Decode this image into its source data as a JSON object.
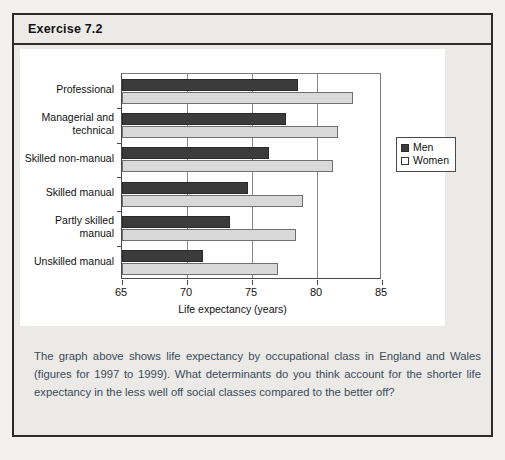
{
  "exercise": {
    "title": "Exercise 7.2",
    "caption": "The graph above shows life expectancy by occupational class in England and Wales (figures for 1997 to 1999). What determinants do you think account for the shorter life expectancy in the less well off social classes compared to the better off?"
  },
  "colors": {
    "men_bar": "#3b3b3b",
    "women_bar": "#d9d9d9",
    "panel_bg": "#ffffff",
    "page_bg": "#eceae7",
    "border": "#2b2b2b",
    "caption_text": "#3a4a5a"
  },
  "chart_data": {
    "type": "bar",
    "orientation": "horizontal",
    "title": "",
    "xlabel": "Life expectancy (years)",
    "ylabel": "",
    "xlim": [
      65,
      85
    ],
    "xticks": [
      65,
      70,
      75,
      80,
      85
    ],
    "xtick_labels": [
      "65",
      "70",
      "75",
      "80",
      "85"
    ],
    "grid": true,
    "grid_axis": "x",
    "legend_position": "right",
    "categories": [
      "Professional",
      "Managerial and technical",
      "Skilled non-manual",
      "Skilled manual",
      "Partly skilled manual",
      "Unskilled manual"
    ],
    "category_labels": [
      [
        "Professional"
      ],
      [
        "Managerial and",
        "technical"
      ],
      [
        "Skilled non-manual"
      ],
      [
        "Skilled manual"
      ],
      [
        "Partly skilled",
        "manual"
      ],
      [
        "Unskilled manual"
      ]
    ],
    "series": [
      {
        "name": "Men",
        "color": "#3b3b3b",
        "values": [
          78.5,
          77.6,
          76.3,
          74.7,
          73.3,
          71.2
        ]
      },
      {
        "name": "Women",
        "color": "#d9d9d9",
        "values": [
          82.8,
          81.6,
          81.2,
          78.9,
          78.4,
          77.0
        ]
      }
    ]
  }
}
